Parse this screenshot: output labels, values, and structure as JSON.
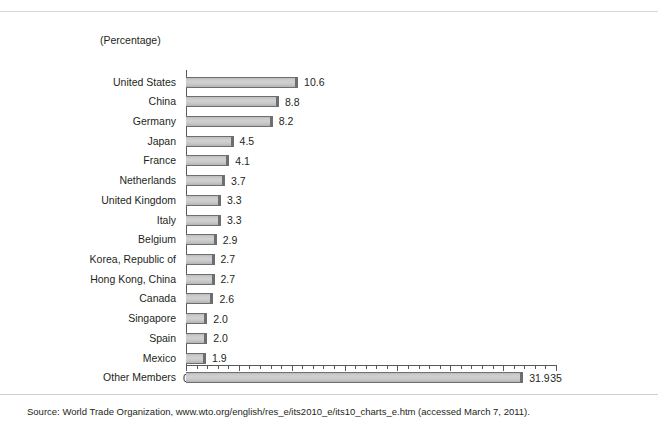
{
  "header": {
    "unit_label": "(Percentage)"
  },
  "footer": {
    "source": "Source: World Trade Organization, www.wto.org/english/res_e/its2010_e/its10_charts_e.htm (accessed March 7, 2011)."
  },
  "chart_data": {
    "type": "bar",
    "orientation": "horizontal",
    "title": "",
    "subtitle": "",
    "xlabel": "",
    "ylabel": "",
    "unit": "(Percentage)",
    "xlim": [
      0,
      35
    ],
    "xticks": [
      0,
      5,
      10,
      15,
      20,
      25,
      30,
      35
    ],
    "xtick_labels": [
      "0",
      "5",
      "10",
      "15",
      "20",
      "25",
      "30",
      "35"
    ],
    "minor_tick_step": 1,
    "grid": false,
    "legend": false,
    "value_labels": true,
    "bar_color": "#c9c9c9",
    "bar_edge_color": "#6d6e70",
    "categories": [
      "United States",
      "China",
      "Germany",
      "Japan",
      "France",
      "Netherlands",
      "United Kingdom",
      "Italy",
      "Belgium",
      "Korea, Republic of",
      "Hong Kong, China",
      "Canada",
      "Singapore",
      "Spain",
      "Mexico",
      "Other Members"
    ],
    "values": [
      10.6,
      8.8,
      8.2,
      4.5,
      4.1,
      3.7,
      3.3,
      3.3,
      2.9,
      2.7,
      2.7,
      2.6,
      2.0,
      2.0,
      1.9,
      31.9
    ],
    "value_text": [
      "10.6",
      "8.8",
      "8.2",
      "4.5",
      "4.1",
      "3.7",
      "3.3",
      "3.3",
      "2.9",
      "2.7",
      "2.7",
      "2.6",
      "2.0",
      "2.0",
      "1.9",
      "31.9"
    ]
  }
}
